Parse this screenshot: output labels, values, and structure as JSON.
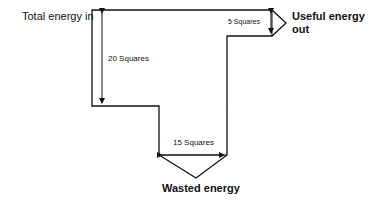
{
  "diagram": {
    "type": "sankey-energy-diagram",
    "labels": {
      "input": "Total energy in",
      "useful_line1": "Useful energy",
      "useful_line2": "out",
      "wasted": "Wasted energy"
    },
    "measurements": {
      "input_width": "20 Squares",
      "useful_width": "5 Squares",
      "wasted_width": "15 Squares"
    },
    "values": {
      "total_in_squares": 20,
      "useful_out_squares": 5,
      "wasted_squares": 15
    },
    "colors": {
      "line": "#111111",
      "background": "#ffffff"
    }
  }
}
